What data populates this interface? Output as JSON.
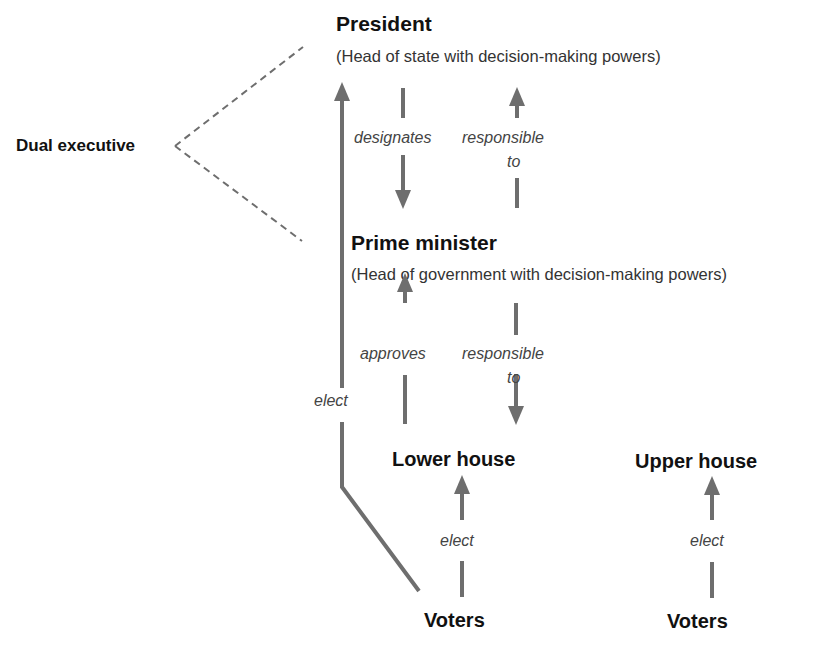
{
  "diagram": {
    "type": "dual executive semi-presidential system",
    "colors": {
      "line": "#6e6e6e",
      "title": "#111111",
      "subtitle": "#333333",
      "relation": "#444444"
    },
    "group_label": "Dual executive",
    "nodes": {
      "president": {
        "title": "President",
        "subtitle": "(Head of state with decision-making powers)"
      },
      "prime_minister": {
        "title": "Prime minister",
        "subtitle": "(Head of government with decision-making powers)"
      },
      "lower_house": {
        "title": "Lower house"
      },
      "upper_house": {
        "title": "Upper house"
      },
      "voters_lower": {
        "title": "Voters"
      },
      "voters_upper": {
        "title": "Voters"
      }
    },
    "relations": {
      "president_designates_pm": "designates",
      "pm_responsible_to_president": {
        "line1": "responsible",
        "line2": "to"
      },
      "lower_house_approves_pm": "approves",
      "pm_responsible_to_lower_house": {
        "line1": "responsible",
        "line2": "to"
      },
      "voters_elect_president": "elect",
      "voters_elect_lower_house": "elect",
      "voters_elect_upper_house": "elect"
    },
    "edges": [
      {
        "from": "voters_lower",
        "to": "president",
        "label": "elect",
        "direction": "up"
      },
      {
        "from": "president",
        "to": "prime_minister",
        "label": "designates",
        "direction": "down"
      },
      {
        "from": "prime_minister",
        "to": "president",
        "label": "responsible to",
        "direction": "up"
      },
      {
        "from": "lower_house",
        "to": "prime_minister",
        "label": "approves",
        "direction": "up"
      },
      {
        "from": "prime_minister",
        "to": "lower_house",
        "label": "responsible to",
        "direction": "down"
      },
      {
        "from": "voters_lower",
        "to": "lower_house",
        "label": "elect",
        "direction": "up"
      },
      {
        "from": "voters_upper",
        "to": "upper_house",
        "label": "elect",
        "direction": "up"
      }
    ]
  }
}
